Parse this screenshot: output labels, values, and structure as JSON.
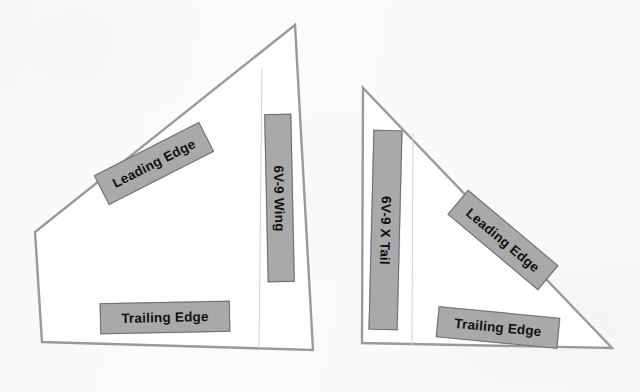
{
  "canvas": {
    "width": 640,
    "height": 392,
    "background_color": "#fbfbf9"
  },
  "style": {
    "label_fill_color": "#a9a9a9",
    "label_border_color": "#6f6f6f",
    "label_text_color": "#111111",
    "outline_stroke_color": "#9a9a9a",
    "shape_fill_color": "#ffffff",
    "fold_line_color": "#d8d6d2"
  },
  "diagram": {
    "type": "paper-template-layout"
  },
  "shapes": [
    {
      "id": "wing",
      "name": "6V-9 Wing",
      "outline_points": "295,25 35,232 42,342 313,350",
      "fold_line_points": "262,68 259,348",
      "labels": [
        {
          "id": "wing-leading-edge",
          "text": "Leading Edge",
          "orientation": "rotated",
          "angle_deg": -27
        },
        {
          "id": "wing-trailing-edge",
          "text": "Trailing Edge",
          "orientation": "horizontal",
          "angle_deg": -1.2
        },
        {
          "id": "wing-name",
          "text": "6V-9 Wing",
          "orientation": "vertical",
          "angle_deg": -1.2
        }
      ]
    },
    {
      "id": "x-tail",
      "name": "6V-9 X Tail",
      "outline_points": "363,88 362,343 612,348",
      "fold_line_points": "413,133 412,345",
      "labels": [
        {
          "id": "tail-name",
          "text": "6V-9 X Tail",
          "orientation": "vertical",
          "angle_deg": 1.4
        },
        {
          "id": "tail-leading-edge",
          "text": "Leading Edge",
          "orientation": "rotated",
          "angle_deg": 40
        },
        {
          "id": "tail-trailing-edge",
          "text": "Trailing Edge",
          "orientation": "horizontal",
          "angle_deg": 5.5
        }
      ]
    }
  ]
}
